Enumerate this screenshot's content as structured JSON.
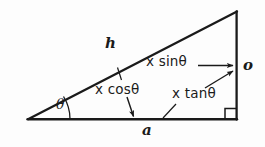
{
  "figure": {
    "kind": "right-triangle-trigonometry-diagram",
    "background_color": "#fdfdfd",
    "ink_color": "#1a1a1a",
    "labels": {
      "hypotenuse": "h",
      "adjacent": "a",
      "opposite": "o",
      "angle": "θ",
      "opposite_expression": "x sinθ",
      "adjacent_expression": "x cosθ",
      "tangent_expression": "x tanθ"
    },
    "geometry": {
      "vertex_left": [
        28,
        119
      ],
      "vertex_apex": [
        237,
        11
      ],
      "vertex_right": [
        237,
        119
      ],
      "right_angle_marker": true,
      "angle_arc_label": "θ"
    },
    "annotations": [
      {
        "name": "x-sin-arrow",
        "text": "x sinθ",
        "points_to": "opposite-side"
      },
      {
        "name": "x-cos-arrow",
        "text": "x cosθ",
        "points_to": "adjacent-side"
      },
      {
        "name": "x-tan-arrow",
        "text": "x tanθ",
        "points_to": "opposite-side"
      }
    ]
  }
}
